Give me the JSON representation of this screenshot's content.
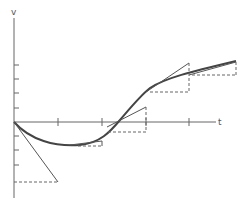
{
  "diagram": {
    "axes": {
      "y_label": "v",
      "x_label": "t",
      "x_ticks": 4,
      "y_ticks_above": 4,
      "y_ticks_below": 3
    },
    "curve": {
      "name": "v(t)",
      "shape": "dips below axis from origin, minimum near first tick, rises through axis, concave down at right"
    },
    "tangents": [
      {
        "at": "origin",
        "direction": "down-right",
        "triangle": "dashed horizontal under"
      },
      {
        "at": "minimum",
        "direction": "nearly flat",
        "triangle": "small thin"
      },
      {
        "at": "axis crossing",
        "direction": "up-right",
        "triangle": "dashed below"
      },
      {
        "at": "third tick",
        "direction": "up-right steep",
        "triangle": "dashed below"
      },
      {
        "at": "fourth tick",
        "direction": "up-right shallow",
        "triangle": "dashed below"
      }
    ],
    "colors": {
      "axis": "#666666",
      "curve": "#444444",
      "tangent": "#555555",
      "dashed": "#666666"
    }
  }
}
